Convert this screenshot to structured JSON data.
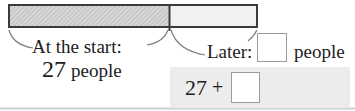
{
  "tape": {
    "start_label": "At the start:",
    "start_value": "27",
    "start_unit": "people",
    "later_label": "Later:",
    "later_unit": "people",
    "later_box_value": ""
  },
  "expression": {
    "operand": "27",
    "operator": "+",
    "box_value": ""
  },
  "colors": {
    "bar_border": "#3b3b3b",
    "hatch_base": "#d8d8d8",
    "hatch_line": "#bfbfbf",
    "right_segment_fill": "#f1f1f1",
    "leader_line": "#7d7d7d",
    "panel_bg": "#ececec",
    "box_border": "#9b9b9b",
    "bottom_rule": "#d0d0d0",
    "text": "#1c1c1c"
  }
}
